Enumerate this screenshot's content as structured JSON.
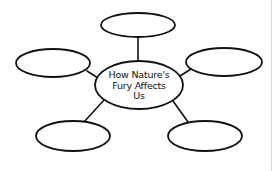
{
  "diagram": {
    "type": "concept-web",
    "center": {
      "label_lines": [
        "How Nature's",
        "Fury Affects",
        "Us"
      ],
      "cx": 139,
      "cy": 85,
      "rx": 44,
      "ry": 24
    },
    "satellites": [
      {
        "name": "top",
        "label": "",
        "cx": 138,
        "cy": 25,
        "rx": 37,
        "ry": 12
      },
      {
        "name": "left",
        "label": "",
        "cx": 53,
        "cy": 63,
        "rx": 37,
        "ry": 14
      },
      {
        "name": "right",
        "label": "",
        "cx": 224,
        "cy": 62,
        "rx": 38,
        "ry": 14
      },
      {
        "name": "bottom-left",
        "label": "",
        "cx": 73,
        "cy": 136,
        "rx": 37,
        "ry": 15
      },
      {
        "name": "bottom-right",
        "label": "",
        "cx": 205,
        "cy": 136,
        "rx": 37,
        "ry": 15
      }
    ],
    "connectors": [
      {
        "to": "top",
        "x1": 138,
        "y1": 37,
        "x2": 138,
        "y2": 61
      },
      {
        "to": "left",
        "x1": 87,
        "y1": 71,
        "x2": 98,
        "y2": 78
      },
      {
        "to": "right",
        "x1": 180,
        "y1": 76,
        "x2": 191,
        "y2": 69
      },
      {
        "to": "bottom-left",
        "x1": 104,
        "y1": 100,
        "x2": 84,
        "y2": 122
      },
      {
        "to": "bottom-right",
        "x1": 173,
        "y1": 101,
        "x2": 188,
        "y2": 122
      }
    ],
    "colors": {
      "stroke": "#111111",
      "fill": "#ffffff",
      "background": "#ffffff"
    }
  }
}
